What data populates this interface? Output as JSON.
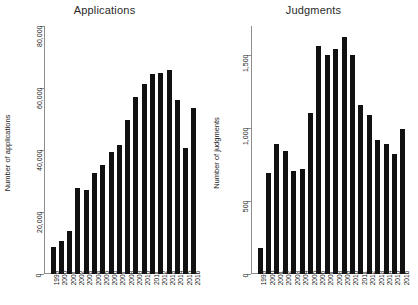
{
  "figure": {
    "panels": [
      {
        "title": "Applications",
        "ylabel": "Number of applications"
      },
      {
        "title": "Judgments",
        "ylabel": "Number of judgments"
      }
    ]
  },
  "chart_data": [
    {
      "type": "bar",
      "title": "Applications",
      "xlabel": "",
      "ylabel": "Number of applications",
      "categories": [
        "1999",
        "2000",
        "2001",
        "2002",
        "2003",
        "2004",
        "2005",
        "2006",
        "2007",
        "2008",
        "2009",
        "2010",
        "2011",
        "2012",
        "2013",
        "2014",
        "2015",
        "2016"
      ],
      "values": [
        8700,
        10500,
        13800,
        27800,
        27000,
        32500,
        35300,
        39300,
        41700,
        49600,
        57100,
        61300,
        64500,
        65000,
        65800,
        56200,
        40600,
        53500
      ],
      "ylim": [
        0,
        80000
      ],
      "yticks": [
        0,
        20000,
        40000,
        60000,
        80000
      ],
      "ytick_labels": [
        "0",
        "20,000",
        "40,000",
        "60,000",
        "80,000"
      ],
      "grid": false,
      "legend": "none",
      "bar_color": "#111111"
    },
    {
      "type": "bar",
      "title": "Judgments",
      "xlabel": "",
      "ylabel": "Number of judgments",
      "categories": [
        "1999",
        "2000",
        "2001",
        "2002",
        "2003",
        "2004",
        "2005",
        "2006",
        "2007",
        "2008",
        "2009",
        "2010",
        "2011",
        "2012",
        "2013",
        "2014",
        "2015",
        "2016"
      ],
      "values": [
        180,
        690,
        889,
        844,
        703,
        718,
        1105,
        1560,
        1503,
        1543,
        1625,
        1499,
        1157,
        1093,
        916,
        891,
        823,
        993
      ],
      "ylim": [
        0,
        1700
      ],
      "yticks": [
        0,
        500,
        1000,
        1500
      ],
      "ytick_labels": [
        "0",
        "500",
        "1,000",
        "1,500"
      ],
      "grid": false,
      "legend": "none",
      "bar_color": "#111111"
    }
  ]
}
